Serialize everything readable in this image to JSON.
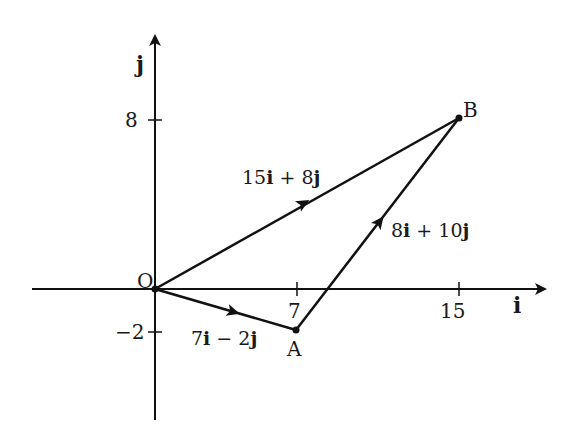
{
  "diagram": {
    "type": "vector-triangle",
    "axes": {
      "x_label": "i",
      "y_label": "j",
      "x_ticks": [
        {
          "value": 7,
          "label": "7"
        },
        {
          "value": 15,
          "label": "15"
        }
      ],
      "y_ticks": [
        {
          "value": 8,
          "label": "8"
        },
        {
          "value": -2,
          "label": "-2"
        }
      ]
    },
    "points": [
      {
        "id": "O",
        "label": "O",
        "x": 0,
        "y": 0
      },
      {
        "id": "A",
        "label": "A",
        "x": 7,
        "y": -2
      },
      {
        "id": "B",
        "label": "B",
        "x": 15,
        "y": 8
      }
    ],
    "vectors": [
      {
        "from": "O",
        "to": "A",
        "coef_i": "7",
        "op": "−",
        "coef_j": "2",
        "label": "7i − 2j"
      },
      {
        "from": "O",
        "to": "B",
        "coef_i": "15",
        "op": "+",
        "coef_j": "8",
        "label": "15i + 8j"
      },
      {
        "from": "A",
        "to": "B",
        "coef_i": "8",
        "op": "+",
        "coef_j": "10",
        "label": "8i + 10j"
      }
    ]
  },
  "text": {
    "x_axis": "i",
    "y_axis": "j",
    "tick_x7": "7",
    "tick_x15": "15",
    "tick_y8": "8",
    "tick_ym2": "−2",
    "pt_O": "O",
    "pt_A": "A",
    "pt_B": "B",
    "vOA": {
      "i": "7",
      "op": " − ",
      "j": "2",
      "iu": "i",
      "ju": "j"
    },
    "vOB": {
      "i": "15",
      "op": " + ",
      "j": "8",
      "iu": "i",
      "ju": "j"
    },
    "vAB": {
      "i": "8",
      "op": " + ",
      "j": "10",
      "iu": "i",
      "ju": "j"
    }
  }
}
